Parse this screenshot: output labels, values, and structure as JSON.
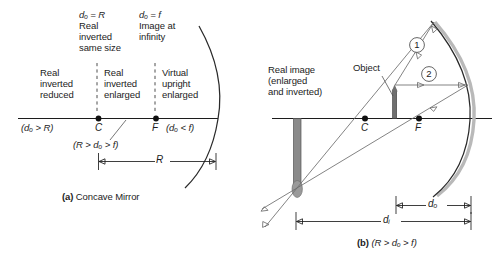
{
  "figure": {
    "background": "#ffffff",
    "ink": "#1c1c1c",
    "ray_color": "#6d6d6d",
    "object_color": "#6f6f6f",
    "image_color": "#8a8a8a"
  },
  "panel_a": {
    "caption_prefix": "(a)",
    "caption_text": "Concave Mirror",
    "top_labels": [
      {
        "eq": "dₒ = R",
        "lines": [
          "Real",
          "inverted",
          "same size"
        ]
      },
      {
        "eq": "dₒ = f",
        "lines": [
          "Image at",
          "infinity"
        ]
      }
    ],
    "zones": [
      {
        "lines": [
          "Real",
          "inverted",
          "reduced"
        ]
      },
      {
        "lines": [
          "Real",
          "inverted",
          "enlarged"
        ]
      },
      {
        "lines": [
          "Virtual",
          "upright",
          "enlarged"
        ]
      }
    ],
    "axis_labels": {
      "left_condition": "(dₒ > R)",
      "center_point": "C",
      "focus_point": "F",
      "right_condition": "(dₒ < f)",
      "middle_condition": "(R > dₒ > f)"
    },
    "dimension": {
      "label": "R"
    }
  },
  "panel_b": {
    "caption_prefix": "(b)",
    "caption_text": "(R > dₒ > f)",
    "image_label": [
      "Real image",
      "(enlarged",
      "and inverted)"
    ],
    "object_label": "Object",
    "ray_labels": [
      "1",
      "2"
    ],
    "points": {
      "center": "C",
      "focus": "F"
    },
    "dimensions": [
      {
        "label": "dₒ"
      },
      {
        "label": "dᵢ"
      }
    ]
  }
}
